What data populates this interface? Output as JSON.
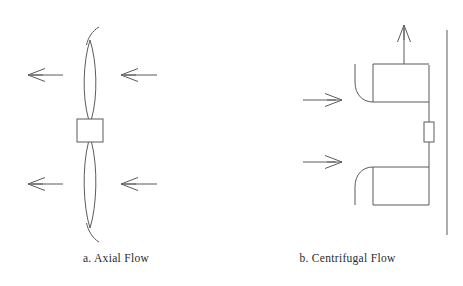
{
  "figure": {
    "background_color": "#ffffff",
    "stroke_color": "#5b5b5b",
    "text_color": "#2b2b2b",
    "panels": [
      {
        "id": "axial-flow",
        "caption": "a. Axial Flow",
        "description": "Axial flow impeller: two lens-shaped blades on a vertical shaft with a rectangular hub, flow arrows pointing left on both sides of the blades.",
        "components": {
          "hub_label": "hub",
          "blade_upper_label": "upper-blade",
          "blade_lower_label": "lower-blade",
          "arrows": [
            {
              "name": "upper-outer-flow-arrow",
              "direction": "left"
            },
            {
              "name": "upper-inner-flow-arrow",
              "direction": "left"
            },
            {
              "name": "lower-outer-flow-arrow",
              "direction": "left"
            },
            {
              "name": "lower-inner-flow-arrow",
              "direction": "left"
            }
          ]
        }
      },
      {
        "id": "centrifugal-flow",
        "caption": "b. Centrifugal Flow",
        "description": "Centrifugal flow impeller: two hooked vane sections against a vertical casing wall, inlet arrows pointing right and a discharge arrow pointing up.",
        "components": {
          "casing_wall_label": "casing-wall",
          "shaft_label": "shaft",
          "vane_upper_label": "upper-vane",
          "vane_lower_label": "lower-vane",
          "hub_block_label": "hub-block",
          "arrows": [
            {
              "name": "upper-inlet-arrow",
              "direction": "right"
            },
            {
              "name": "lower-inlet-arrow",
              "direction": "right"
            },
            {
              "name": "discharge-arrow",
              "direction": "up"
            }
          ]
        }
      }
    ]
  },
  "captions": {
    "axial": "a. Axial Flow",
    "centrifugal": "b. Centrifugal Flow"
  }
}
